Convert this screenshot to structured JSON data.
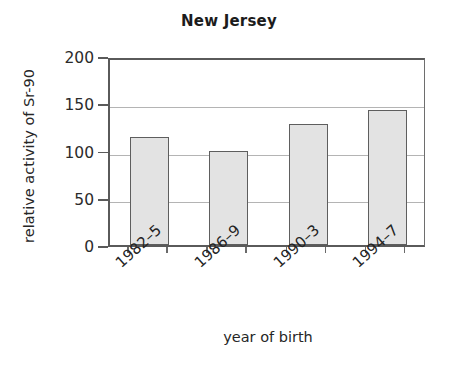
{
  "chart_data": {
    "type": "bar",
    "title": "New Jersey",
    "xlabel": "year of birth",
    "ylabel": "relative activity of Sr-90",
    "categories": [
      "1982–5",
      "1986–9",
      "1990–3",
      "1994–7"
    ],
    "values": [
      114,
      100,
      128,
      143
    ],
    "ylim": [
      0,
      200
    ],
    "yticks": [
      0,
      50,
      100,
      150,
      200
    ],
    "ytick_labels": [
      "0",
      "50",
      "100",
      "150",
      "200"
    ],
    "grid": "horizontal",
    "legend": "none",
    "bar_fill_color": "#e3e3e3",
    "bar_edge_color": "#5e5e5e",
    "axis_color": "#5a5a5a",
    "gridline_color": "#b4b4b4",
    "background_color": "#ffffff",
    "text_color": "#242424"
  }
}
